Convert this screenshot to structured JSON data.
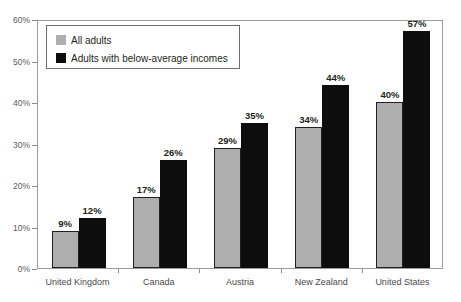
{
  "chart_data": {
    "type": "bar",
    "title": "",
    "subtitle": "",
    "xlabel": "",
    "ylabel": "",
    "ylim": [
      0,
      60
    ],
    "grid": false,
    "legend_position": "top-left",
    "categories": [
      "United Kingdom",
      "Canada",
      "Austria",
      "New Zealand",
      "United States"
    ],
    "y_ticks": [
      "0%",
      "10%",
      "20%",
      "30%",
      "40%",
      "50%",
      "60%"
    ],
    "y_tick_values": [
      0,
      10,
      20,
      30,
      40,
      50,
      60
    ],
    "series": [
      {
        "name": "All adults",
        "color": "#aeaeae",
        "values": [
          9,
          17,
          29,
          34,
          40
        ],
        "labels": [
          "9%",
          "17%",
          "29%",
          "34%",
          "40%"
        ]
      },
      {
        "name": "Adults with below-average incomes",
        "color": "#0d0d0d",
        "values": [
          12,
          26,
          35,
          44,
          57
        ],
        "labels": [
          "12%",
          "26%",
          "35%",
          "44%",
          "57%"
        ]
      }
    ]
  },
  "legend": {
    "items": [
      {
        "label": "All adults",
        "color": "#aeaeae"
      },
      {
        "label": "Adults with below-average incomes",
        "color": "#0d0d0d"
      }
    ]
  }
}
